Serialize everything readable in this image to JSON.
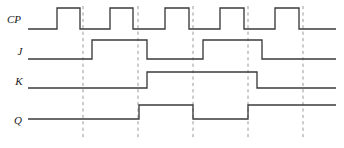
{
  "diagram": {
    "type": "digital-timing-waveform",
    "width": 344,
    "height": 148,
    "background_color": "#ffffff",
    "waveform_color": "#3b3b3b",
    "marker_color": "#9a9a9a",
    "label_color": "#1a1a1a",
    "time_axis": {
      "start": 28,
      "end": 336
    },
    "signals": [
      {
        "name": "CP",
        "label": "CP",
        "label_x": 14,
        "label_y": 23,
        "level_high_y": 8,
        "level_low_y": 29,
        "initial_level": "low",
        "transitions": [
          {
            "x": 57,
            "to": "high"
          },
          {
            "x": 80,
            "to": "low"
          },
          {
            "x": 110,
            "to": "high"
          },
          {
            "x": 133,
            "to": "low"
          },
          {
            "x": 165,
            "to": "high"
          },
          {
            "x": 189,
            "to": "low"
          },
          {
            "x": 220,
            "to": "high"
          },
          {
            "x": 244,
            "to": "low"
          },
          {
            "x": 275,
            "to": "high"
          },
          {
            "x": 299,
            "to": "low"
          }
        ],
        "pulse_count": 5
      },
      {
        "name": "J",
        "label": "J",
        "label_x": 20,
        "label_y": 55,
        "level_high_y": 40,
        "level_low_y": 59,
        "initial_level": "low",
        "transitions": [
          {
            "x": 92,
            "to": "high"
          },
          {
            "x": 147,
            "to": "low"
          },
          {
            "x": 203,
            "to": "high"
          },
          {
            "x": 262,
            "to": "low"
          }
        ],
        "pulse_count": 2
      },
      {
        "name": "K",
        "label": "K",
        "label_x": 19,
        "label_y": 85,
        "level_high_y": 72,
        "level_low_y": 88,
        "initial_level": "low",
        "transitions": [
          {
            "x": 147,
            "to": "high"
          },
          {
            "x": 257,
            "to": "low"
          }
        ],
        "pulse_count": 1
      },
      {
        "name": "Q",
        "label": "Q",
        "label_x": 18,
        "label_y": 124,
        "level_high_y": 105,
        "level_low_y": 119,
        "initial_level": "low",
        "transitions": [
          {
            "x": 139,
            "to": "high"
          },
          {
            "x": 193,
            "to": "low"
          },
          {
            "x": 248,
            "to": "high"
          }
        ],
        "pulse_count": 2
      }
    ],
    "marker_lines": [
      {
        "x": 83,
        "y_top": 6,
        "y_bottom": 140
      },
      {
        "x": 138,
        "y_top": 6,
        "y_bottom": 140
      },
      {
        "x": 193,
        "y_top": 6,
        "y_bottom": 140
      },
      {
        "x": 248,
        "y_top": 6,
        "y_bottom": 140
      },
      {
        "x": 303,
        "y_top": 6,
        "y_bottom": 140
      }
    ]
  }
}
